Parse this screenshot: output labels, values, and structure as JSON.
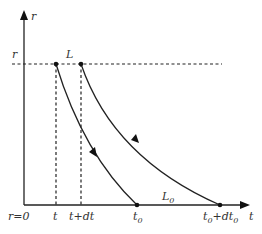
{
  "diagram": {
    "axes": {
      "y_label": "r",
      "x_label": "t",
      "origin_label": "r=0"
    },
    "levels": {
      "r_level_label": "r",
      "line_L_label": "L",
      "line_L0_label": "L",
      "line_L0_subscript": "0"
    },
    "ticks": {
      "t": "t",
      "t_plus_dt": "t+dt",
      "t0_main": "t",
      "t0_sub": "0",
      "t0_plus_dt0_main1": "t",
      "t0_plus_dt0_sub1": "0",
      "t0_plus_dt0_mid": "+dt",
      "t0_plus_dt0_sub2": "0"
    },
    "curves": [
      {
        "name": "worldline-1",
        "from": "(t, r)",
        "to": "(t0, 0)",
        "direction": "downward"
      },
      {
        "name": "worldline-2",
        "from": "(t+dt, r)",
        "to": "(t0+dt0, 0)",
        "direction": "downward"
      }
    ],
    "colors": {
      "ink": "#222222",
      "background": "#ffffff"
    }
  }
}
